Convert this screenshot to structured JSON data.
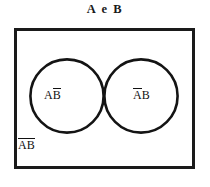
{
  "figure": {
    "title": "A e B",
    "background_color": "#ffffff",
    "ink_color": "#111111"
  },
  "diagram": {
    "type": "venn",
    "universe_shape": "rectangle",
    "universe": {
      "x": 14,
      "y": 28,
      "width": 180,
      "height": 140,
      "stroke_width": 3
    },
    "circles": [
      {
        "name": "A",
        "cx": 67,
        "cy": 96,
        "r": 37,
        "fill": "none",
        "stroke_width": 2.6
      },
      {
        "name": "B",
        "cx": 141,
        "cy": 96,
        "r": 37,
        "fill": "none",
        "stroke_width": 2.6
      }
    ],
    "shaded_region": {
      "name": "intersection",
      "expression": "A ∩ B",
      "fill_color": "#0d0d0d"
    },
    "labels": [
      {
        "id": "a-not-b",
        "prefix": "A",
        "overlined": "B",
        "full": "AB̅",
        "overline_span": "suffix"
      },
      {
        "id": "not-a-b",
        "overlined": "A",
        "suffix": "B",
        "full": "A̅B",
        "overline_span": "prefix"
      },
      {
        "id": "not-a-not-b",
        "overlined": "AB",
        "full": "A̅B̅",
        "overline_span": "all"
      }
    ]
  }
}
